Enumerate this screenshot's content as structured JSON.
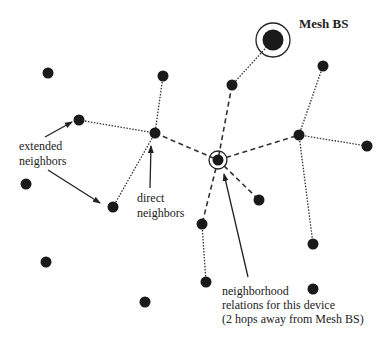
{
  "labels": {
    "mesh_bs": "Mesh BS",
    "extended_line1": "extended",
    "extended_line2": "neighbors",
    "direct_line1": "direct",
    "direct_line2": "neighbors",
    "relations_line1": "neighborhood",
    "relations_line2": "relations for this device",
    "relations_line3": "(2 hops away from Mesh BS)"
  },
  "colors": {
    "node": "#1a1a1a",
    "line": "#333333",
    "background": "#ffffff"
  },
  "nodes": [
    {
      "id": "bs",
      "x": 273,
      "y": 40,
      "type": "mesh-bs"
    },
    {
      "id": "n1",
      "x": 232,
      "y": 85
    },
    {
      "id": "n2",
      "x": 48,
      "y": 73
    },
    {
      "id": "n3",
      "x": 163,
      "y": 76
    },
    {
      "id": "n4",
      "x": 79,
      "y": 120
    },
    {
      "id": "n5",
      "x": 155,
      "y": 133
    },
    {
      "id": "dev",
      "x": 218,
      "y": 160,
      "type": "this-device"
    },
    {
      "id": "n6",
      "x": 299,
      "y": 135
    },
    {
      "id": "n7",
      "x": 367,
      "y": 146
    },
    {
      "id": "n8",
      "x": 323,
      "y": 66
    },
    {
      "id": "n9",
      "x": 26,
      "y": 184
    },
    {
      "id": "n10",
      "x": 113,
      "y": 207
    },
    {
      "id": "n11",
      "x": 259,
      "y": 200
    },
    {
      "id": "n12",
      "x": 202,
      "y": 224
    },
    {
      "id": "n13",
      "x": 313,
      "y": 244
    },
    {
      "id": "n14",
      "x": 46,
      "y": 262
    },
    {
      "id": "n15",
      "x": 206,
      "y": 282
    },
    {
      "id": "n16",
      "x": 313,
      "y": 289
    },
    {
      "id": "n17",
      "x": 145,
      "y": 302
    }
  ]
}
